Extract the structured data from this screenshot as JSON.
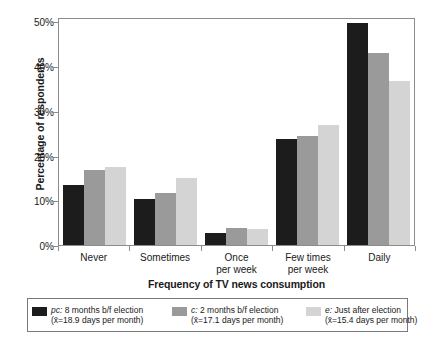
{
  "chart_data": {
    "type": "bar",
    "title": "",
    "xlabel": "Frequency of TV news consumption",
    "ylabel": "Percentage of respondents",
    "categories": [
      "Never",
      "Sometimes",
      "Once per week",
      "Few times per week",
      "Daily"
    ],
    "category_lines": [
      [
        "Never"
      ],
      [
        "Sometimes"
      ],
      [
        "Once",
        "per week"
      ],
      [
        "Few times",
        "per week"
      ],
      [
        "Daily"
      ]
    ],
    "ylim": [
      0,
      51
    ],
    "ytick_values": [
      0,
      10,
      20,
      30,
      40,
      50
    ],
    "ytick_labels": [
      "0%",
      "10%",
      "20%",
      "30%",
      "40%",
      "50%"
    ],
    "grid": false,
    "legend_position": "bottom",
    "series": [
      {
        "name": "pc: 8 months b/f election",
        "key": "pc",
        "color": "#1c1c1c",
        "values": [
          13.5,
          10.3,
          2.6,
          23.8,
          49.7
        ]
      },
      {
        "name": "c: 2 months b/f election",
        "key": "c",
        "color": "#9a9a9a",
        "values": [
          16.8,
          11.6,
          3.8,
          24.3,
          42.9
        ]
      },
      {
        "name": "e: Just after election",
        "key": "e",
        "color": "#d4d4d4",
        "values": [
          17.5,
          14.9,
          3.6,
          26.8,
          36.6
        ]
      }
    ]
  },
  "legend": {
    "entries": [
      {
        "prefix": "pc:",
        "label": " 8 months b/f election",
        "sub": "(x̄=18.9 days per month)",
        "swatch": "#1c1c1c"
      },
      {
        "prefix": "c:",
        "label": " 2 months b/f election",
        "sub": "(x̄=17.1 days per month)",
        "swatch": "#9a9a9a"
      },
      {
        "prefix": "e:",
        "label": " Just after election",
        "sub": "(x̄=15.4 days per month)",
        "swatch": "#d4d4d4"
      }
    ]
  }
}
